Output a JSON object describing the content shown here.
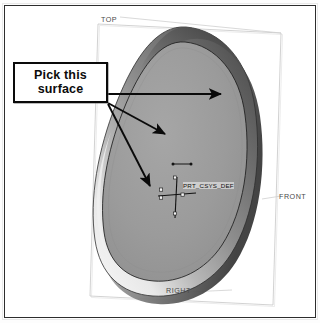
{
  "document": {
    "type": "cad-screenshot",
    "application": "3D CAD modeling viewport",
    "background_color": "#ffffff",
    "frame_color": "#2d2d2d"
  },
  "callout": {
    "line1": "Pick this",
    "line2": "surface",
    "border_color": "#0a0a0a",
    "fill_color": "#ffffff",
    "text_color": "#0c0c0c",
    "arrow_count": 3,
    "arrow_color": "#0a0a0a"
  },
  "model": {
    "name": "egg-shaped-solid",
    "description": "Shaded ovoid solid with a revolved rim and a recessed top face",
    "face_color": "#9a9a9a",
    "rim_light_color": "#e4e4e4",
    "rim_dark_color": "#4e4e4e",
    "outline_color": "#2a2a2a"
  },
  "datum_planes": [
    {
      "id": "top",
      "label": "TOP",
      "position": "upper-left"
    },
    {
      "id": "front",
      "label": "FRONT",
      "position": "right-edge"
    },
    {
      "id": "right",
      "label": "RIGHT",
      "position": "bottom-center"
    }
  ],
  "coordinate_system": {
    "label": "PRT_CSYS_DEF",
    "axes": [
      "X",
      "Y",
      "Z"
    ],
    "marker_color": "#111111"
  },
  "annotations": {
    "dimension_tick_label": ""
  }
}
